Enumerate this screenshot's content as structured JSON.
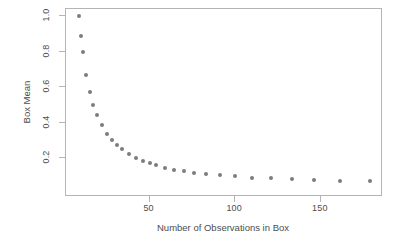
{
  "chart_data": {
    "type": "scatter",
    "title": "",
    "xlabel": "Number of Observations in Box",
    "ylabel": "Box Mean",
    "xlim": [
      5,
      190
    ],
    "ylim": [
      0.0,
      1.03
    ],
    "grid": false,
    "legend": null,
    "xticks": [
      50,
      100,
      150
    ],
    "xticklabels": [
      "50",
      "100",
      "150"
    ],
    "yticks": [
      0.2,
      0.4,
      0.6,
      0.8,
      1.0
    ],
    "yticklabels": [
      "0.2",
      "0.4",
      "0.6",
      "0.8",
      "1.0"
    ],
    "marker": {
      "shape": "circle",
      "color": "#7d7d7d",
      "size_px": 4
    },
    "frame": {
      "color": "#b4b4b4",
      "style": "box"
    },
    "x": [
      9,
      10,
      11,
      13,
      15,
      17,
      19,
      22,
      25,
      28,
      31,
      34,
      38,
      42,
      46,
      50,
      54,
      59,
      64,
      70,
      76,
      83,
      91,
      100,
      110,
      121,
      133,
      146,
      161,
      179
    ],
    "y": [
      1.0,
      0.89,
      0.8,
      0.67,
      0.57,
      0.5,
      0.445,
      0.385,
      0.335,
      0.3,
      0.272,
      0.248,
      0.222,
      0.2,
      0.185,
      0.172,
      0.158,
      0.145,
      0.135,
      0.126,
      0.118,
      0.11,
      0.102,
      0.096,
      0.09,
      0.085,
      0.08,
      0.076,
      0.072,
      0.068
    ],
    "series": [
      {
        "name": "Box Mean vs Observations",
        "points": [
          {
            "x": 9,
            "y": 1.0
          },
          {
            "x": 10,
            "y": 0.89
          },
          {
            "x": 11,
            "y": 0.8
          },
          {
            "x": 13,
            "y": 0.67
          },
          {
            "x": 15,
            "y": 0.57
          },
          {
            "x": 17,
            "y": 0.5
          },
          {
            "x": 19,
            "y": 0.445
          },
          {
            "x": 22,
            "y": 0.385
          },
          {
            "x": 25,
            "y": 0.335
          },
          {
            "x": 28,
            "y": 0.3
          },
          {
            "x": 31,
            "y": 0.272
          },
          {
            "x": 34,
            "y": 0.248
          },
          {
            "x": 38,
            "y": 0.222
          },
          {
            "x": 42,
            "y": 0.2
          },
          {
            "x": 46,
            "y": 0.185
          },
          {
            "x": 50,
            "y": 0.172
          },
          {
            "x": 54,
            "y": 0.158
          },
          {
            "x": 59,
            "y": 0.145
          },
          {
            "x": 64,
            "y": 0.135
          },
          {
            "x": 70,
            "y": 0.126
          },
          {
            "x": 76,
            "y": 0.118
          },
          {
            "x": 83,
            "y": 0.11
          },
          {
            "x": 91,
            "y": 0.102
          },
          {
            "x": 100,
            "y": 0.096
          },
          {
            "x": 110,
            "y": 0.09
          },
          {
            "x": 121,
            "y": 0.085
          },
          {
            "x": 133,
            "y": 0.08
          },
          {
            "x": 146,
            "y": 0.076
          },
          {
            "x": 161,
            "y": 0.072
          },
          {
            "x": 179,
            "y": 0.068
          }
        ]
      }
    ]
  }
}
